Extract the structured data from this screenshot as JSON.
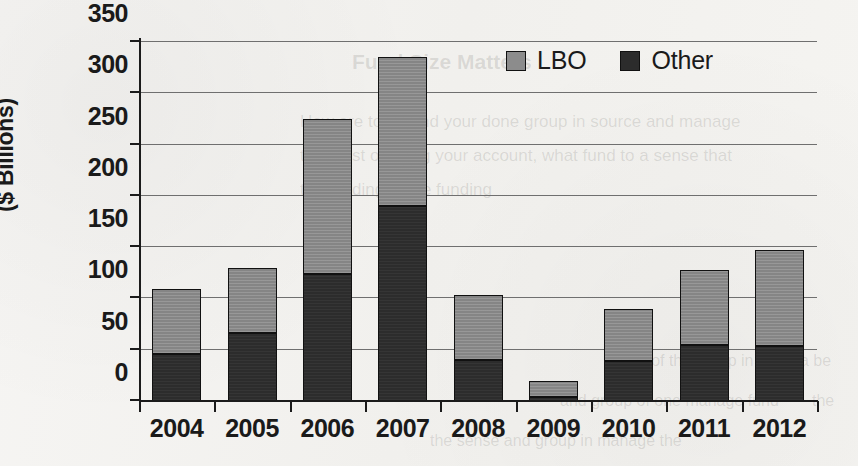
{
  "chart_data": {
    "type": "bar",
    "subtype": "stacked-vertical",
    "title": "",
    "xlabel": "",
    "ylabel": "($ Billions)",
    "ylim": [
      0,
      350
    ],
    "ytick_values": [
      0,
      50,
      100,
      150,
      200,
      250,
      300,
      350
    ],
    "ytick_labels": [
      "0",
      "50",
      "100",
      "150",
      "200",
      "250",
      "300",
      "350"
    ],
    "categories": [
      "2004",
      "2005",
      "2006",
      "2007",
      "2008",
      "2009",
      "2010",
      "2011",
      "2012"
    ],
    "grid": true,
    "grid_axis": "y",
    "legend_position": "top-right",
    "stack_order": [
      "Other",
      "LBO"
    ],
    "series": [
      {
        "name": "Other",
        "color": "#2c2c2c",
        "values": [
          46,
          66,
          124,
          190,
          40,
          4,
          39,
          55,
          54
        ]
      },
      {
        "name": "LBO",
        "color": "#8c8c8c",
        "values": [
          63,
          64,
          151,
          145,
          63,
          16,
          51,
          73,
          93
        ]
      }
    ],
    "totals": [
      109,
      130,
      275,
      335,
      103,
      20,
      90,
      128,
      147
    ]
  },
  "legend": {
    "items": [
      {
        "label": "LBO",
        "swatch": "#8c8c8c"
      },
      {
        "label": "Other",
        "swatch": "#2c2c2c"
      }
    ]
  },
  "background_bleed": [
    {
      "text": "Fund Size Matters",
      "x": 352,
      "y": 50,
      "size": 21,
      "weight": "bold"
    },
    {
      "text": "How are to do and your done group in source and manage",
      "x": 300,
      "y": 112,
      "size": 17,
      "weight": "normal"
    },
    {
      "text": "the most of doing your account, what fund to a sense that",
      "x": 300,
      "y": 146,
      "size": 17,
      "weight": "normal"
    },
    {
      "text": "the funding of the funding",
      "x": 300,
      "y": 180,
      "size": 17,
      "weight": "normal"
    },
    {
      "text": "to a of the group in hand",
      "x": 620,
      "y": 352,
      "size": 16,
      "weight": "normal"
    },
    {
      "text": "a be",
      "x": 800,
      "y": 352,
      "size": 16,
      "weight": "normal"
    },
    {
      "text": "and group of one manage fund",
      "x": 560,
      "y": 392,
      "size": 16,
      "weight": "normal"
    },
    {
      "text": "the",
      "x": 812,
      "y": 392,
      "size": 16,
      "weight": "normal"
    },
    {
      "text": "the sense and group in manage the",
      "x": 430,
      "y": 432,
      "size": 16,
      "weight": "normal"
    }
  ]
}
